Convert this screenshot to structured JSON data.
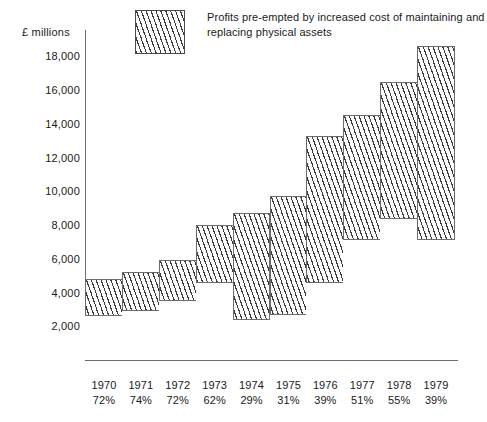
{
  "axis": {
    "y_title": "£ millions",
    "y_ticks": [
      "18,000",
      "16,000",
      "14,000",
      "12,000",
      "10,000",
      "8,000",
      "6,000",
      "4,000",
      "2,000"
    ]
  },
  "legend": {
    "swatch_name": "hatched-pattern-swatch",
    "text": "Profits pre-empted by increased cost of maintaining and replacing physical assets"
  },
  "chart_data": {
    "type": "bar",
    "title": "",
    "subtitle": "",
    "xlabel": "",
    "ylabel": "£ millions",
    "ylim": [
      0,
      19500
    ],
    "ytick_values": [
      2000,
      4000,
      6000,
      8000,
      10000,
      12000,
      14000,
      16000,
      18000
    ],
    "grid": false,
    "legend_position": "top-center",
    "stacked": true,
    "categories": [
      "1970",
      "1971",
      "1972",
      "1973",
      "1974",
      "1975",
      "1976",
      "1977",
      "1978",
      "1979"
    ],
    "category_sublabels": [
      "72%",
      "74%",
      "72%",
      "62%",
      "29%",
      "31%",
      "39%",
      "51%",
      "55%",
      "39%"
    ],
    "totals": [
      4800,
      5200,
      5900,
      8000,
      8700,
      9700,
      13300,
      14500,
      16500,
      18600
    ],
    "series": [
      {
        "name": "Profits pre-empted by increased cost of maintaining and replacing physical assets",
        "style": "hatched",
        "values": [
          2150,
          2250,
          2350,
          3400,
          6250,
          7000,
          8650,
          7350,
          8100,
          11400
        ]
      },
      {
        "name": "Remaining profits",
        "style": "plain",
        "values": [
          2650,
          2950,
          3550,
          4600,
          2450,
          2700,
          4650,
          7150,
          8400,
          7200
        ]
      }
    ],
    "percent_labels": [
      72,
      74,
      72,
      62,
      29,
      31,
      39,
      51,
      55,
      39
    ]
  },
  "colors": {
    "line": "#6b6b6b",
    "hatch": "#3b3b3b",
    "background": "#ffffff",
    "text": "#1a1a1a"
  }
}
